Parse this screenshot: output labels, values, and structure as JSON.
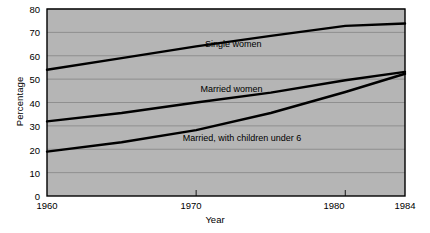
{
  "chart_data": {
    "type": "line",
    "title": "",
    "xlabel": "Year",
    "ylabel": "Percentage",
    "xlim": [
      1960,
      1984
    ],
    "ylim": [
      0,
      80
    ],
    "xticks": [
      1960,
      1970,
      1980,
      1984
    ],
    "yticks": [
      0,
      10,
      20,
      30,
      40,
      50,
      60,
      70,
      80
    ],
    "grid": "horizontal",
    "legend": "inline-labels",
    "plot_background": "#b5b5b5",
    "line_color": "#000000",
    "gridline_color": "#8f8f8f",
    "series": [
      {
        "name": "Single women",
        "label": "Single women",
        "label_x": 1970.6,
        "label_y": 64.5,
        "x": [
          1960,
          1965,
          1970,
          1975,
          1980,
          1984
        ],
        "values": [
          54,
          59,
          64,
          68.5,
          72.8,
          73.8
        ]
      },
      {
        "name": "Married women",
        "label": "Married women",
        "label_x": 1970.3,
        "label_y": 45.5,
        "x": [
          1960,
          1965,
          1970,
          1975,
          1980,
          1984
        ],
        "values": [
          31.9,
          35.5,
          40.0,
          44.2,
          49.5,
          53.1
        ]
      },
      {
        "name": "Married, with children under 6",
        "label": "Married, with children under 6",
        "label_x": 1969.1,
        "label_y": 24.5,
        "x": [
          1960,
          1965,
          1970,
          1975,
          1980,
          1984
        ],
        "values": [
          19.0,
          23.0,
          28.2,
          35.5,
          44.5,
          52.3
        ]
      }
    ]
  },
  "axis": {
    "ytick_labels": [
      "80",
      "70",
      "60",
      "50",
      "40",
      "30",
      "20",
      "10",
      "0"
    ],
    "xtick_labels": [
      "1960",
      "1970",
      "1980",
      "1984"
    ],
    "y_title": "Percentage",
    "x_title": "Year"
  },
  "labels": {
    "single_women": "Single women",
    "married_women": "Married women",
    "married_children": "Married, with children under 6"
  }
}
